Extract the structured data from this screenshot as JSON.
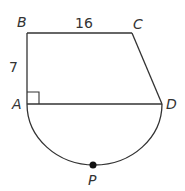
{
  "diagram": {
    "type": "geometry-figure",
    "points": {
      "B": {
        "label": "B",
        "x": 27,
        "y": 33
      },
      "C": {
        "label": "C",
        "x": 132,
        "y": 33
      },
      "D": {
        "label": "D",
        "x": 162,
        "y": 104
      },
      "A": {
        "label": "A",
        "x": 27,
        "y": 104
      },
      "P": {
        "label": "P",
        "x": 93,
        "y": 165
      }
    },
    "segments": [
      {
        "from": "B",
        "to": "C",
        "length_label": "16"
      },
      {
        "from": "A",
        "to": "B",
        "length_label": "7"
      },
      {
        "from": "C",
        "to": "D",
        "length_label": ""
      },
      {
        "from": "A",
        "to": "D",
        "length_label": ""
      }
    ],
    "right_angle_at": "A",
    "arc": {
      "from": "A",
      "to": "D",
      "through": "P",
      "kind": "semicircle"
    },
    "measurements": {
      "BC": "16",
      "AB": "7"
    },
    "colors": {
      "stroke": "#333333",
      "label": "#333333",
      "point": "#111111"
    }
  }
}
